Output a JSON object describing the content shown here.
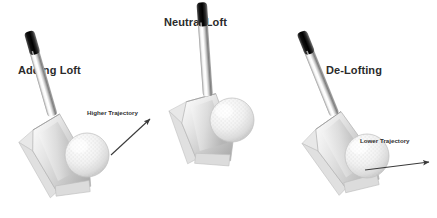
{
  "diagram": {
    "background_color": "#ffffff",
    "width": 437,
    "height": 218
  },
  "panels": [
    {
      "id": "adding-loft",
      "title": "Adding Loft",
      "shaft_lean": "backward",
      "trajectory_label": "Higher Trajectory",
      "has_arrow": true,
      "arrow_direction": "up-right"
    },
    {
      "id": "neutral-loft",
      "title": "Neutral Loft",
      "shaft_lean": "vertical",
      "trajectory_label": "",
      "has_arrow": false,
      "arrow_direction": "none"
    },
    {
      "id": "de-lofting",
      "title": "De-Lofting",
      "shaft_lean": "forward",
      "trajectory_label": "Lower Trajectory",
      "has_arrow": true,
      "arrow_direction": "right"
    }
  ],
  "colors": {
    "title_text": "#2b2b2b",
    "label_text": "#2f2f2f",
    "arrow": "#3a3a3a",
    "grip_dark": "#1a1a1a",
    "shaft_light": "#f2f2f2",
    "shaft_mid": "#b9b9b9",
    "head_light": "#ececec",
    "head_mid": "#cfcfcf",
    "head_shadow": "#a8a8a8",
    "ball_light": "#fbfbfb",
    "ball_shadow": "#cdcdcd"
  }
}
